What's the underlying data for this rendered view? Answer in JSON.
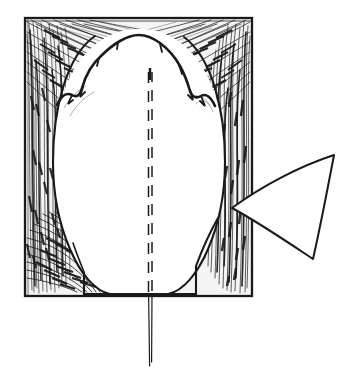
{
  "figure": {
    "domain": "Diagram",
    "kind": "hand-drawn line-art anatomical illustration",
    "alt_text": "Pen-and-ink drawing: a rectangular block of hatched fibrous tissue surrounds a large pale oval mass; a dashed vertical midline runs down the oval centre and continues below the block as a fine double-stroke suture tail; a hollow triangular arrow at the right points left toward the lower-right margin of the block.",
    "background_color": "#ffffff",
    "ink_color": "#1a1a1a",
    "fill_color": "#ffffff",
    "canvas": {
      "width": 358,
      "height": 386
    }
  },
  "elements": {
    "frame": {
      "name": "tissue-block-frame",
      "label": "Rectangular tissue block border",
      "x": 25,
      "y": 18,
      "width": 227,
      "height": 278,
      "stroke_width": 2.2
    },
    "oval": {
      "name": "central-oval-mass",
      "label": "Central pale oval mass",
      "center_x": 139,
      "center_y": 162,
      "radius_x": 86,
      "radius_y": 133,
      "top_edge_style": "scalloped",
      "scallop_count": 5
    },
    "midline": {
      "name": "dashed-midline-incision",
      "label": "Dashed midline incision",
      "x": 150,
      "y_start": 72,
      "y_end": 292,
      "dash_count": 12,
      "stroke_style": "double-stroke dashed"
    },
    "suture_tail": {
      "name": "suture-thread-tail",
      "label": "Suture thread tail below block",
      "x": 150,
      "y_start": 296,
      "y_end": 366,
      "stroke_style": "double-stroke solid"
    },
    "arrow": {
      "name": "retraction-arrow",
      "label": "Hollow triangular retraction arrow",
      "apex_x": 232,
      "apex_y": 208,
      "tip_top_x": 334,
      "tip_top_y": 155,
      "tip_bottom_x": 313,
      "tip_bottom_y": 259,
      "direction": "points-left",
      "fill": "none"
    },
    "base_notch": {
      "name": "basal-notch-outline",
      "label": "Basal notch outline at block floor",
      "left_x": 84,
      "right_x": 196,
      "y": 294
    },
    "hatching": {
      "name": "fibrous-hatching",
      "label": "Fibrous / muscular hatch shading",
      "regions": [
        "top-left",
        "top-right",
        "left-margin",
        "right-margin",
        "bottom-left"
      ],
      "stroke_color": "#1a1a1a"
    }
  }
}
